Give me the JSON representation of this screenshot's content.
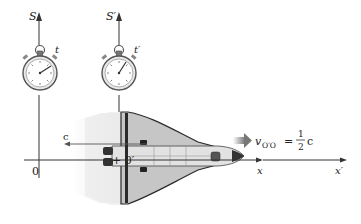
{
  "frames": {
    "S": {
      "axis_label": "S",
      "time_label": "t",
      "origin_label": "0",
      "x_label": "x"
    },
    "S_prime": {
      "axis_label": "S′",
      "time_label": "t′",
      "origin_label": "+ 0′",
      "x_label": "x′"
    }
  },
  "light_label": "c",
  "velocity": {
    "symbol": "v",
    "subscript": "O′O",
    "equals": "=",
    "numerator": "1",
    "denominator": "2",
    "unit": "c"
  },
  "colors": {
    "line": "#333333",
    "shuttle_body": "#d8d8d8",
    "shuttle_wing": "#b0b0b0",
    "shuttle_dark": "#2a2a2a",
    "blur": "#eeeeee",
    "arrow_gray": "#888888"
  }
}
